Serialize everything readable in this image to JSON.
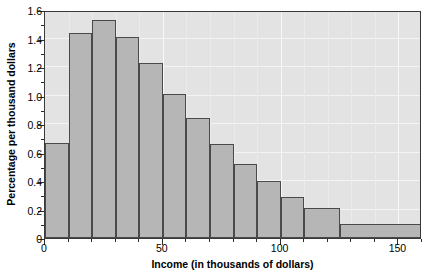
{
  "chart_data": {
    "type": "bar",
    "title": "",
    "subtitle": "",
    "xlabel": "Income (in thousands of dollars)",
    "ylabel": "Percentage per thousand dollars",
    "xlim": [
      0,
      160
    ],
    "ylim": [
      0,
      1.6
    ],
    "grid": true,
    "legend": null,
    "x_ticks": [
      0,
      50,
      100,
      150
    ],
    "x_tick_labels": [
      "0",
      "50",
      "100",
      "150"
    ],
    "x_minor_ticks": [
      10,
      20,
      30,
      40,
      60,
      70,
      80,
      90,
      110,
      120,
      130,
      140,
      160
    ],
    "y_ticks": [
      0,
      0.2,
      0.4,
      0.6,
      0.8,
      1.0,
      1.2,
      1.4,
      1.6
    ],
    "y_tick_labels": [
      "0",
      "0.2",
      "0.4",
      "0.6",
      "0.8",
      "1.0",
      "1.2",
      "1.4",
      "1.6"
    ],
    "bin_edges": [
      0,
      10,
      20,
      30,
      40,
      50,
      60,
      70,
      80,
      90,
      100,
      110,
      125,
      160
    ],
    "values": [
      0.67,
      1.44,
      1.53,
      1.41,
      1.23,
      1.01,
      0.84,
      0.66,
      0.52,
      0.4,
      0.29,
      0.21,
      0.1
    ],
    "bars": [
      {
        "x0": 0,
        "x1": 10,
        "value": 0.67
      },
      {
        "x0": 10,
        "x1": 20,
        "value": 1.44
      },
      {
        "x0": 20,
        "x1": 30,
        "value": 1.53
      },
      {
        "x0": 30,
        "x1": 40,
        "value": 1.41
      },
      {
        "x0": 40,
        "x1": 50,
        "value": 1.23
      },
      {
        "x0": 50,
        "x1": 60,
        "value": 1.01
      },
      {
        "x0": 60,
        "x1": 70,
        "value": 0.84
      },
      {
        "x0": 70,
        "x1": 80,
        "value": 0.66
      },
      {
        "x0": 80,
        "x1": 90,
        "value": 0.52
      },
      {
        "x0": 90,
        "x1": 100,
        "value": 0.4
      },
      {
        "x0": 100,
        "x1": 110,
        "value": 0.29
      },
      {
        "x0": 110,
        "x1": 125,
        "value": 0.21
      },
      {
        "x0": 125,
        "x1": 160,
        "value": 0.1
      }
    ],
    "colors": {
      "bar_fill": "#b6b6b6",
      "bar_edge": "#4a4a4a",
      "plot_background": "#e3e3e3",
      "gridline": "#f4f4f4",
      "axis": "#3a3a3a",
      "text": "#000000",
      "page_background": "#ffffff"
    }
  }
}
